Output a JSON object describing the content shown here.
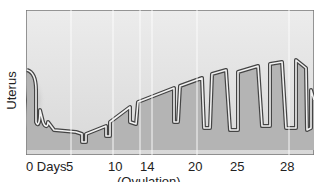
{
  "diagram": {
    "y_axis_label": "Uterus",
    "x_axis": {
      "ticks": [
        {
          "label": "0 Days",
          "x": 26
        },
        {
          "label": "5",
          "x": 66
        },
        {
          "label": "10",
          "x": 108
        },
        {
          "label": "14",
          "x": 145
        },
        {
          "label": "20",
          "x": 192
        },
        {
          "label": "25",
          "x": 232
        },
        {
          "label": "28",
          "x": 281
        }
      ],
      "annotation": "(Ovulation)"
    },
    "colors": {
      "background_upper": "#e6e6e6",
      "tissue_fill": "#b4b4b4",
      "gland_dark": "#555555",
      "outline": "#444444",
      "gridline": "#ffffff"
    }
  }
}
